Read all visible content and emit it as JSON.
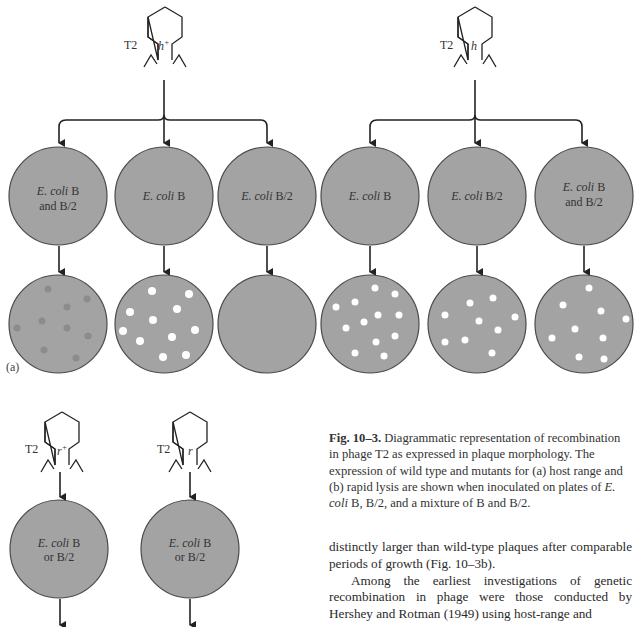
{
  "figure": {
    "panel_a": {
      "label": "(a)",
      "phages": [
        {
          "name": "T2",
          "genotype": "h",
          "sup": "+",
          "x": 187
        },
        {
          "name": "T2",
          "genotype": "h",
          "sup": "",
          "x": 475
        }
      ],
      "plates_left": [
        {
          "line1_italic": "E. coli",
          "line1_rest": " B",
          "line2": "and B/2",
          "result": "turbid"
        },
        {
          "line1_italic": "E. coli",
          "line1_rest": " B",
          "line2": "",
          "result": "clear"
        },
        {
          "line1_italic": "E. coli",
          "line1_rest": " B/2",
          "line2": "",
          "result": "none"
        }
      ],
      "plates_right": [
        {
          "line1_italic": "E. coli",
          "line1_rest": " B",
          "line2": "",
          "result": "clear"
        },
        {
          "line1_italic": "E. coli",
          "line1_rest": " B/2",
          "line2": "",
          "result": "clear"
        },
        {
          "line1_italic": "E. coli",
          "line1_rest": " B",
          "line2": "and B/2",
          "result": "clear"
        }
      ]
    },
    "panel_b": {
      "phages": [
        {
          "name": "T2",
          "genotype": "r",
          "sup": "+"
        },
        {
          "name": "T2",
          "genotype": "r",
          "sup": ""
        }
      ],
      "plates": [
        {
          "line1_italic": "E. coli",
          "line1_rest": " B",
          "line2": "or B/2"
        },
        {
          "line1_italic": "E. coli",
          "line1_rest": " B",
          "line2": "or B/2"
        }
      ]
    },
    "colors": {
      "plate_fill": "#a3a3a3",
      "plate_stroke": "#4a4a4a",
      "turbid_plaque": "#8c8c8c",
      "clear_plaque": "#ffffff",
      "line": "#222222"
    }
  },
  "caption": {
    "fig_label": "Fig. 10–3.",
    "text_1": " Diagrammatic representation of recombination in phage T2 as expressed in plaque morphology. The expression of wild type and mutants for (a) host range and (b) rapid lysis are shown when inoculated on plates of ",
    "italic": "E. coli",
    "text_2": " B, B/2, and a mixture of B and B/2."
  },
  "body": {
    "para1": "distinctly larger than wild-type plaques after comparable periods of growth (Fig. 10–3b).",
    "para2": "Among the earliest investigations of genetic recombination in phage were those conducted by Hershey and Rotman (1949) using host-range and"
  }
}
